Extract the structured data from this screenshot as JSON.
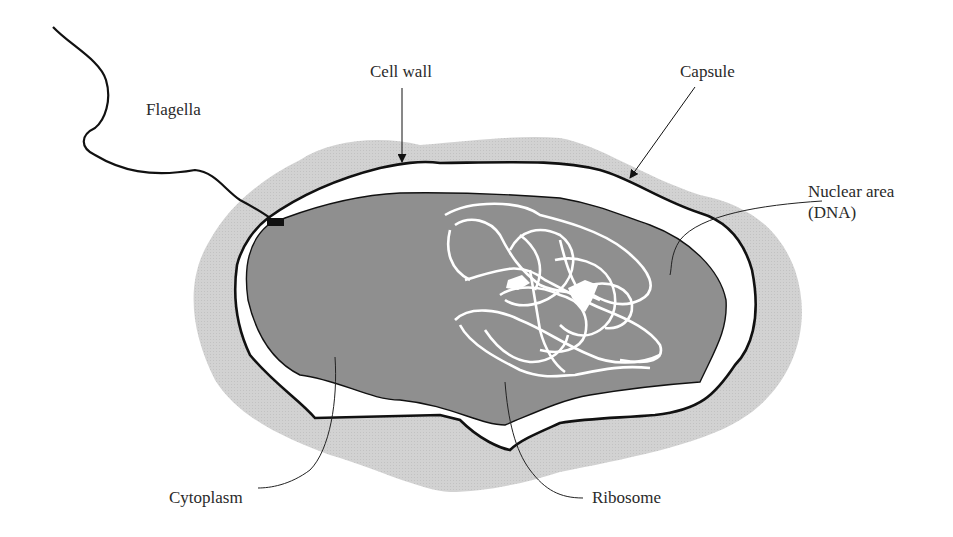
{
  "colors": {
    "background": "#ffffff",
    "capsule": "#cfcfcf",
    "periplasm": "#ffffff",
    "cytoplasm": "#8f8f8f",
    "dna": "#ffffff",
    "outline": "#111111",
    "leader": "#222222",
    "text": "#2a2a2a"
  },
  "labels": {
    "flagella": "Flagella",
    "cell_wall": "Cell wall",
    "capsule": "Capsule",
    "nuclear_area_line1": "Nuclear area",
    "nuclear_area_line2": "(DNA)",
    "cytoplasm": "Cytoplasm",
    "ribosome": "Ribosome"
  }
}
